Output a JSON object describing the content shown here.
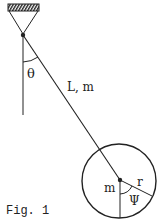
{
  "figure": {
    "caption": "Fig. 1",
    "labels": {
      "theta": "θ",
      "rod": "L, m",
      "disk_mass": "m",
      "radius": "r",
      "psi": "Ψ"
    },
    "colors": {
      "ink": "#222222",
      "background": "#ffffff"
    }
  }
}
